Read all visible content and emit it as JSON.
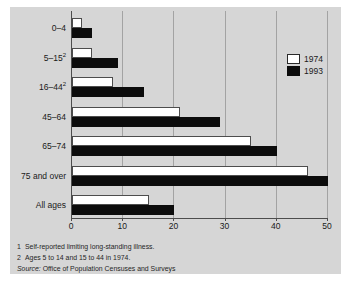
{
  "chart_data": {
    "type": "bar",
    "orientation": "horizontal",
    "title": "",
    "xlabel": "",
    "ylabel": "",
    "xlim": [
      0,
      50
    ],
    "xticks": [
      0,
      10,
      20,
      30,
      40,
      50
    ],
    "grid": "vertical",
    "legend_position": "upper-right-inside",
    "categories": [
      {
        "label": "0–4",
        "sup": ""
      },
      {
        "label": "5–15",
        "sup": "2"
      },
      {
        "label": "16–44",
        "sup": "2"
      },
      {
        "label": "45–64",
        "sup": ""
      },
      {
        "label": "65–74",
        "sup": ""
      },
      {
        "label": "75 and over",
        "sup": ""
      },
      {
        "label": "All ages",
        "sup": ""
      }
    ],
    "series": [
      {
        "name": "1974",
        "color": "#ffffff",
        "values": [
          2,
          4,
          8,
          21,
          35,
          46,
          15
        ]
      },
      {
        "name": "1993",
        "color": "#0c0c0c",
        "values": [
          4,
          9,
          14,
          29,
          40,
          50,
          20
        ]
      }
    ]
  },
  "footnotes": {
    "notes": [
      {
        "marker": "1",
        "text": "Self-reported limiting long-standing illness."
      },
      {
        "marker": "2",
        "text": "Ages 5 to 14 and 15 to 44 in 1974."
      }
    ],
    "source": {
      "label": "Source:",
      "text": "Office of Population Censuses and Surveys"
    }
  },
  "colors": {
    "panel_bg": "#d6d6d6",
    "gridline": "#a3a3a3",
    "axis": "#4d4d4d",
    "bar_1974": "#ffffff",
    "bar_1993": "#0c0c0c"
  }
}
